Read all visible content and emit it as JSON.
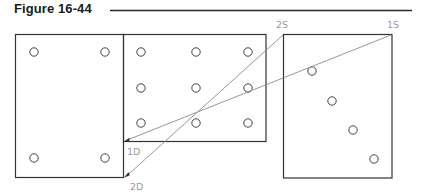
{
  "figure": {
    "title": "Figure 16-44",
    "colors": {
      "title": "#1a1a1a",
      "rule": "#2a2a2a",
      "box": "#333333",
      "hole": "#444444",
      "leader": "#8c8c8c",
      "label": "#9a9a9a"
    },
    "labels": {
      "first_source": "1S",
      "second_source": "2S",
      "first_destination": "1D",
      "second_destination": "2D"
    },
    "panels": [
      {
        "name": "left-panel",
        "hole_count": 4
      },
      {
        "name": "middle-panel",
        "hole_count": 9
      },
      {
        "name": "right-panel",
        "hole_count": 4
      }
    ]
  }
}
